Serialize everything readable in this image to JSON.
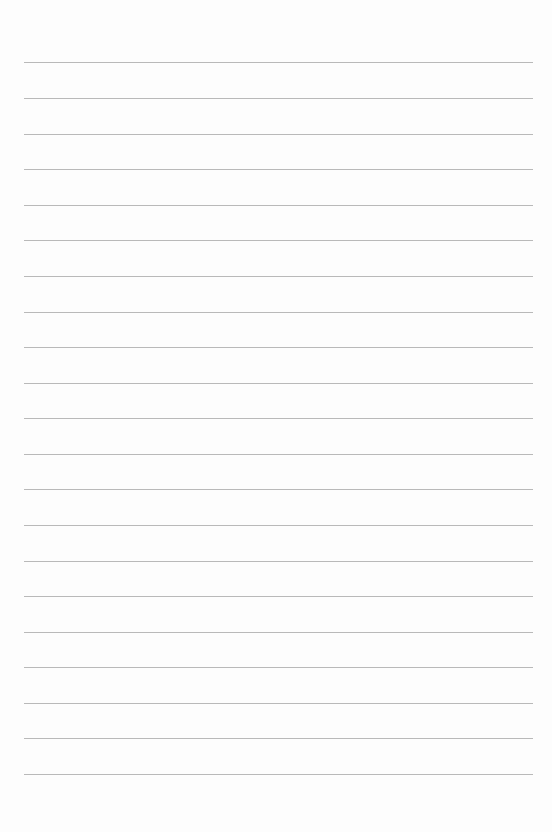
{
  "document": {
    "type": "lined-paper",
    "background_color": "#fdfdfd",
    "rule_color": "#b9b9b9",
    "rule_count": 21,
    "rule_left": 24,
    "rule_width": 509,
    "rule_top_positions": [
      62,
      98,
      134,
      169,
      205,
      240,
      276,
      312,
      347,
      383,
      418,
      454,
      489,
      525,
      561,
      596,
      632,
      667,
      703,
      738,
      774
    ]
  }
}
